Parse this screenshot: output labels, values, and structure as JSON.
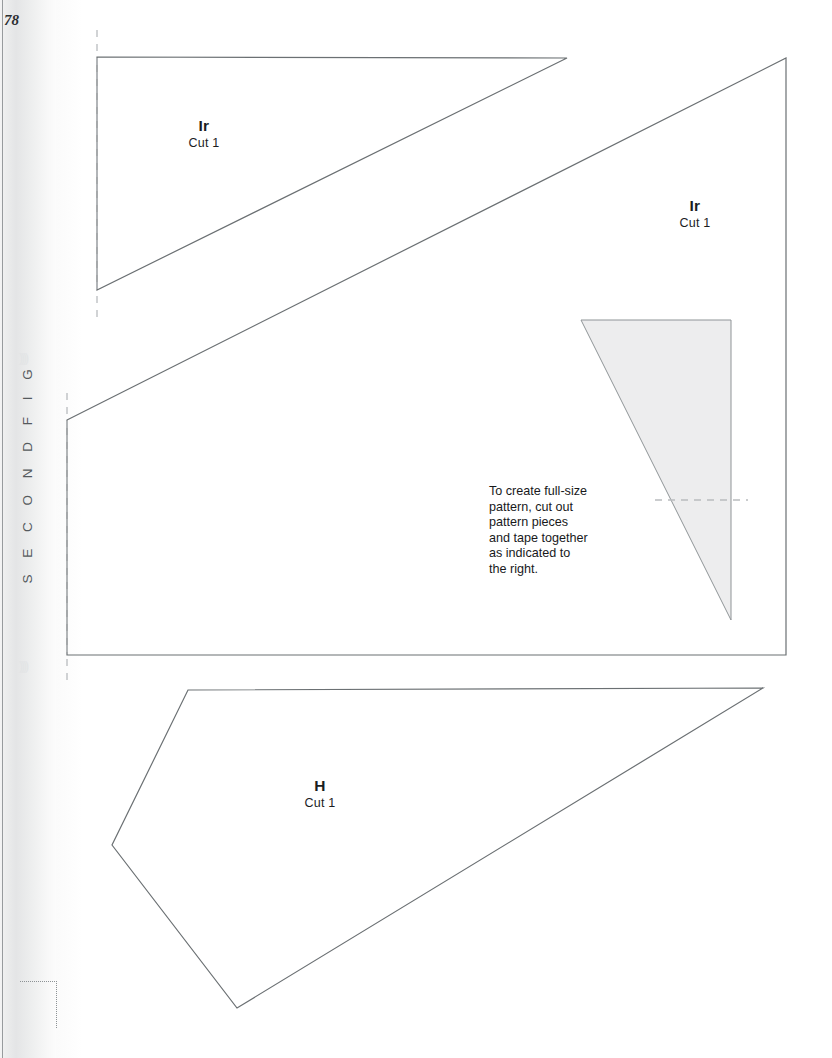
{
  "page": {
    "width": 832,
    "height": 1058,
    "background_color": "#ffffff",
    "line_color": "#6b7073",
    "shaded_fill_color": "#ededee",
    "dashed_guide_color": "#b9bcbf"
  },
  "running_head": {
    "text": "S E C O N D   F I G",
    "ornament_top": "))))",
    "ornament_bottom": "))))"
  },
  "folio": {
    "page_number": "78"
  },
  "labels": [
    {
      "code": "Ir",
      "cut": "Cut 1",
      "x": 204,
      "y": 117
    },
    {
      "code": "Ir",
      "cut": "Cut 1",
      "x": 695,
      "y": 197
    },
    {
      "code": "H",
      "cut": "Cut 1",
      "x": 320,
      "y": 777
    }
  ],
  "note": {
    "lines": [
      "To create full-size",
      "pattern, cut out",
      "pattern pieces",
      "and tape together",
      "as indicated to",
      "the right."
    ]
  },
  "shapes": [
    {
      "name": "pattern-piece-Ir-upper",
      "type": "polygon",
      "points": "97,57 567,58 97,290",
      "fill": "none"
    },
    {
      "name": "pattern-piece-Ir-lower",
      "type": "polygon",
      "points": "67,420 786,58 786,655 67,655",
      "fill": "none"
    },
    {
      "name": "tape-guide-shaded-triangle",
      "type": "polygon",
      "points": "581,320 731,320 731,620",
      "fill": "#ededee"
    },
    {
      "name": "pattern-piece-H",
      "type": "polygon",
      "points": "188,690 763,688 237,1008 112,845",
      "fill": "none"
    }
  ],
  "guides": [
    {
      "name": "dashed-guide-upper-left",
      "orientation": "vertical",
      "x": 97,
      "y1": 30,
      "y2": 322
    },
    {
      "name": "dashed-guide-lower-left",
      "orientation": "vertical",
      "x": 67,
      "y1": 393,
      "y2": 680
    },
    {
      "name": "dashed-guide-tape-right",
      "orientation": "horizontal",
      "y": 500,
      "x1": 655,
      "x2": 748
    }
  ]
}
